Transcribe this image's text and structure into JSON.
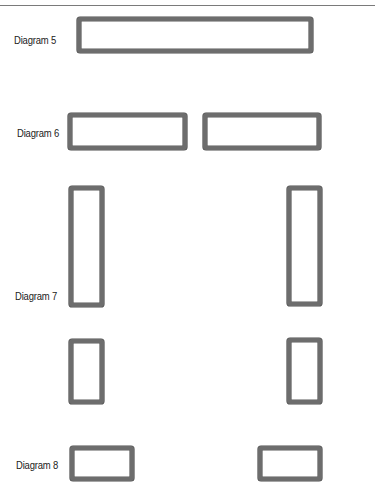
{
  "colors": {
    "frame_border": "#6d6d6d",
    "frame_fill": "#ffffff",
    "label_text": "#222222",
    "rule": "#7a7a7a"
  },
  "diagrams": [
    {
      "label": "Diagram 5",
      "shapes": [
        {
          "name": "wide-frame",
          "x": 77,
          "y": 17,
          "w": 236,
          "h": 36
        }
      ]
    },
    {
      "label": "Diagram 6",
      "shapes": [
        {
          "name": "left-frame",
          "x": 68,
          "y": 113,
          "w": 119,
          "h": 37
        },
        {
          "name": "right-frame",
          "x": 203,
          "y": 113,
          "w": 118,
          "h": 37
        }
      ]
    },
    {
      "label": "Diagram 7",
      "shapes": [
        {
          "name": "tall-left-frame",
          "x": 69,
          "y": 186,
          "w": 35,
          "h": 121
        },
        {
          "name": "tall-right-frame",
          "x": 287,
          "y": 186,
          "w": 35,
          "h": 120
        },
        {
          "name": "short-left-frame",
          "x": 69,
          "y": 339,
          "w": 35,
          "h": 65
        },
        {
          "name": "short-right-frame",
          "x": 287,
          "y": 338,
          "w": 35,
          "h": 66
        }
      ]
    },
    {
      "label": "Diagram 8",
      "shapes": [
        {
          "name": "left-frame",
          "x": 70,
          "y": 446,
          "w": 64,
          "h": 35
        },
        {
          "name": "right-frame",
          "x": 258,
          "y": 446,
          "w": 64,
          "h": 35
        }
      ]
    }
  ]
}
